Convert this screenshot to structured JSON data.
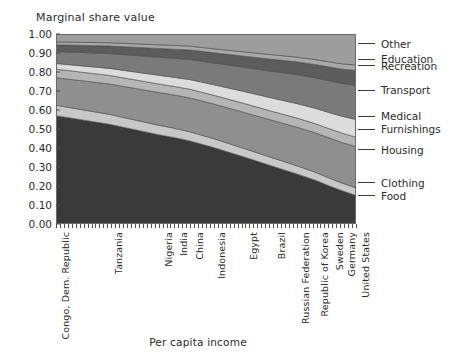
{
  "chart_data": {
    "type": "area",
    "title": "",
    "ylabel": "Marginal share value",
    "xlabel": "Per capita income",
    "ylim": [
      0.0,
      1.0
    ],
    "grid": false,
    "legend_position": "right-outside",
    "ytick_labels": [
      "1.00",
      "0.90",
      "0.80",
      "0.70",
      "0.60",
      "0.50",
      "0.40",
      "0.30",
      "0.20",
      "0.10",
      "0.00"
    ],
    "ytick_values": [
      1.0,
      0.9,
      0.8,
      0.7,
      0.6,
      0.5,
      0.4,
      0.3,
      0.2,
      0.1,
      0.0
    ],
    "categories": [
      "Congo, Dem. Republic",
      "Tanzania",
      "Nigeria",
      "India",
      "China",
      "Indonesia",
      "Egypt",
      "Brazil",
      "Russian Federation",
      "Republic of Korea",
      "Sweden",
      "Germany",
      "United States"
    ],
    "category_x_fraction": [
      0.0,
      0.178,
      0.342,
      0.394,
      0.447,
      0.52,
      0.628,
      0.72,
      0.8,
      0.862,
      0.912,
      0.954,
      1.0
    ],
    "stack_order_bottom_to_top": [
      "Food",
      "Clothing",
      "Housing",
      "Furnishings",
      "Medical",
      "Transport",
      "Recreation",
      "Education",
      "Other"
    ],
    "series": [
      {
        "name": "Food",
        "color": "#3a3a3a",
        "values": [
          0.57,
          0.525,
          0.47,
          0.455,
          0.437,
          0.405,
          0.352,
          0.305,
          0.265,
          0.232,
          0.2,
          0.175,
          0.15
        ]
      },
      {
        "name": "Clothing",
        "color": "#c8c8c8",
        "values": [
          0.055,
          0.052,
          0.05,
          0.049,
          0.048,
          0.047,
          0.045,
          0.044,
          0.043,
          0.042,
          0.041,
          0.04,
          0.04
        ]
      },
      {
        "name": "Housing",
        "color": "#8f8f8f",
        "values": [
          0.145,
          0.16,
          0.172,
          0.175,
          0.178,
          0.182,
          0.19,
          0.197,
          0.203,
          0.207,
          0.211,
          0.214,
          0.217
        ]
      },
      {
        "name": "Furnishings",
        "color": "#b5b5b5",
        "values": [
          0.045,
          0.045,
          0.045,
          0.045,
          0.046,
          0.046,
          0.047,
          0.047,
          0.048,
          0.048,
          0.049,
          0.049,
          0.05
        ]
      },
      {
        "name": "Medical",
        "color": "#dcdcdc",
        "values": [
          0.03,
          0.037,
          0.046,
          0.048,
          0.051,
          0.055,
          0.063,
          0.07,
          0.076,
          0.081,
          0.085,
          0.089,
          0.093
        ]
      },
      {
        "name": "Transport",
        "color": "#7a7a7a",
        "values": [
          0.063,
          0.078,
          0.095,
          0.1,
          0.106,
          0.114,
          0.128,
          0.141,
          0.152,
          0.16,
          0.167,
          0.173,
          0.18
        ]
      },
      {
        "name": "Recreation",
        "color": "#5c5c5c",
        "values": [
          0.035,
          0.04,
          0.046,
          0.048,
          0.05,
          0.053,
          0.058,
          0.063,
          0.067,
          0.07,
          0.073,
          0.075,
          0.078
        ]
      },
      {
        "name": "Education",
        "color": "#a8a8a8",
        "values": [
          0.015,
          0.017,
          0.019,
          0.02,
          0.02,
          0.021,
          0.023,
          0.024,
          0.025,
          0.026,
          0.027,
          0.028,
          0.029
        ]
      },
      {
        "name": "Other",
        "color": "#9d9d9d",
        "values": [
          0.042,
          0.046,
          0.057,
          0.06,
          0.064,
          0.077,
          0.094,
          0.109,
          0.121,
          0.134,
          0.147,
          0.157,
          0.163
        ]
      }
    ],
    "legend": [
      {
        "label": "Other",
        "y_value": 0.948
      },
      {
        "label": "Education",
        "y_value": 0.868
      },
      {
        "label": "Recreation",
        "y_value": 0.833
      },
      {
        "label": "Transport",
        "y_value": 0.703
      },
      {
        "label": "Medical",
        "y_value": 0.568
      },
      {
        "label": "Furnishings",
        "y_value": 0.5
      },
      {
        "label": "Housing",
        "y_value": 0.39
      },
      {
        "label": "Clothing",
        "y_value": 0.218
      },
      {
        "label": "Food",
        "y_value": 0.15
      }
    ]
  }
}
